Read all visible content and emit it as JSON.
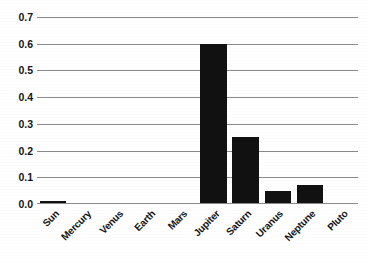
{
  "chart_data": {
    "type": "bar",
    "title": "",
    "xlabel": "",
    "ylabel": "",
    "categories": [
      "Sun",
      "Mercury",
      "Venus",
      "Earth",
      "Mars",
      "Jupiter",
      "Saturn",
      "Uranus",
      "Neptune",
      "Pluto"
    ],
    "values": [
      0.01,
      0,
      0,
      0,
      0,
      0.6,
      0.25,
      0.05,
      0.07,
      0
    ],
    "ylim": [
      0,
      0.7
    ],
    "ytick_step": 0.1,
    "ytick_labels": [
      "0.7",
      "0.6",
      "0.5",
      "0.4",
      "0.3",
      "0.2",
      "0.1",
      "0.0"
    ],
    "ytick_values": [
      0.7,
      0.6,
      0.5,
      0.4,
      0.3,
      0.2,
      0.1,
      0.0
    ],
    "grid": true,
    "legend": false,
    "legend_position": "none",
    "bar_color": "#111111",
    "grid_color": "#8a8a8a",
    "background_color": "#ffffff",
    "xtick_rotation": -45
  }
}
